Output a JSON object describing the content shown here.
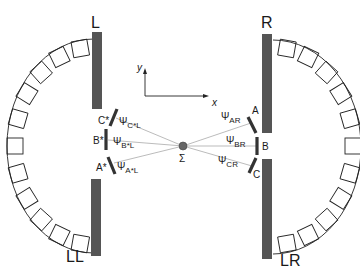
{
  "diagram": {
    "plates": {
      "upper_left": "L",
      "lower_left": "LL",
      "upper_right": "R",
      "lower_right": "LR"
    },
    "axes": {
      "x": "x",
      "y": "y"
    },
    "center": {
      "symbol": "Σ"
    },
    "left_elements": [
      {
        "label": "C*",
        "angle_symbol": "Ψ",
        "angle_sub": "C*L"
      },
      {
        "label": "B*",
        "angle_symbol": "Ψ",
        "angle_sub": "B*L"
      },
      {
        "label": "A*",
        "angle_symbol": "Ψ",
        "angle_sub": "A*L"
      }
    ],
    "right_elements": [
      {
        "label": "A",
        "angle_symbol": "Ψ",
        "angle_sub": "AR"
      },
      {
        "label": "B",
        "angle_symbol": "Ψ",
        "angle_sub": "BR"
      },
      {
        "label": "C",
        "angle_symbol": "Ψ",
        "angle_sub": "CR"
      }
    ],
    "colors": {
      "plate": "#555555",
      "line": "#1a1a1a",
      "ray": "#aaaaaa",
      "center_dot": "#666666"
    }
  }
}
